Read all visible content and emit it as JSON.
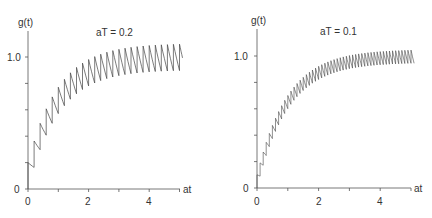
{
  "chart_data": [
    {
      "type": "line",
      "title": "aT = 0.2",
      "xlabel": "at",
      "ylabel": "g(t)",
      "xticks": [
        0,
        1,
        2,
        3,
        4,
        5
      ],
      "xtick_labels": [
        "0",
        "2",
        "4"
      ],
      "xtick_label_values": [
        0,
        2,
        4
      ],
      "yticks": [
        0,
        0.2,
        0.4,
        0.6,
        0.8,
        1.0
      ],
      "ytick_labels": [
        "0",
        "1.0"
      ],
      "xlim": [
        0,
        5.1
      ],
      "ylim": [
        0,
        1.2
      ],
      "grid": false,
      "legend": null,
      "aT": 0.2,
      "description": "Sawtooth response: jump of aT at each sampling instant, exponential decay between; settles between ~0.90 and ~1.10"
    },
    {
      "type": "line",
      "title": "aT = 0.1",
      "xlabel": "at",
      "ylabel": "g(t)",
      "xticks": [
        0,
        1,
        2,
        3,
        4,
        5
      ],
      "xtick_labels": [
        "0",
        "2",
        "4"
      ],
      "xtick_label_values": [
        0,
        2,
        4
      ],
      "yticks": [
        0,
        0.2,
        0.4,
        0.6,
        0.8,
        1.0
      ],
      "ytick_labels": [
        "0",
        "1.0"
      ],
      "xlim": [
        0,
        5.1
      ],
      "ylim": [
        0,
        1.2
      ],
      "grid": false,
      "legend": null,
      "aT": 0.1,
      "description": "Sawtooth response: jump of aT at each sampling instant, exponential decay between; settles between ~0.95 and ~1.05"
    }
  ],
  "panels": [
    {
      "title": "aT = 0.2",
      "ylabel": "g(t)",
      "xlabel": "at",
      "y_one": "1.0",
      "y_zero": "0",
      "x0": "0",
      "x2": "2",
      "x4": "4"
    },
    {
      "title": "aT = 0.1",
      "ylabel": "g(t)",
      "xlabel": "at",
      "y_one": "1.0",
      "y_zero": "0",
      "x0": "0",
      "x2": "2",
      "x4": "4"
    }
  ]
}
